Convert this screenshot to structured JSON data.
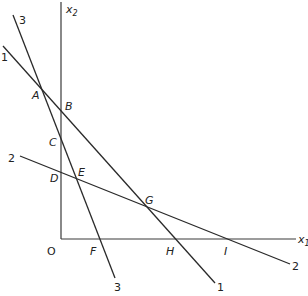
{
  "diagram": {
    "type": "linear-programming-constraint-lines",
    "axes": {
      "x_label": "x",
      "x_subscript": "1",
      "y_label": "x",
      "y_subscript": "2",
      "origin_label": "O"
    },
    "lines": [
      {
        "id": "1",
        "label": "1",
        "start_label": "1",
        "end_label": "1"
      },
      {
        "id": "2",
        "label": "2",
        "start_label": "2",
        "end_label": "2"
      },
      {
        "id": "3",
        "label": "3",
        "start_label": "3",
        "end_label": "3"
      }
    ],
    "points": {
      "A": "A",
      "B": "B",
      "C": "C",
      "D": "D",
      "E": "E",
      "F": "F",
      "G": "G",
      "H": "H",
      "I": "I"
    }
  }
}
